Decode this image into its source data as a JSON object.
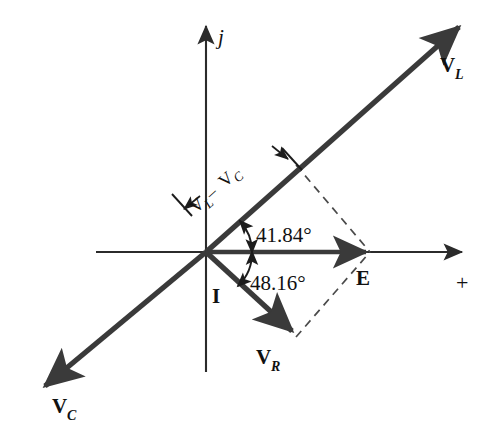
{
  "figure": {
    "background_color": "#ffffff",
    "phasor_color": "#3a3a3a",
    "axis_color": "#2b2b2b",
    "dashed_color": "#4a4a4a",
    "text_color": "#111111"
  },
  "axes": {
    "imaginary": {
      "label": "j",
      "name": "imaginary-axis"
    },
    "real": {
      "label": "+",
      "name": "real-axis"
    }
  },
  "phasors": [
    {
      "id": "VL",
      "label": "V",
      "subscript": "L",
      "name": "phasor-vl",
      "angle_deg": 41.84
    },
    {
      "id": "VC",
      "label": "V",
      "subscript": "C",
      "name": "phasor-vc",
      "angle_deg": 221.84
    },
    {
      "id": "VR",
      "label": "V",
      "subscript": "R",
      "name": "phasor-vr",
      "angle_deg": -48.16
    },
    {
      "id": "I",
      "label": "I",
      "subscript": "",
      "name": "phasor-i",
      "angle_deg": -48.16
    },
    {
      "id": "E",
      "label": "E",
      "subscript": "",
      "name": "phasor-e",
      "angle_deg": 0
    }
  ],
  "annotations": {
    "angle_upper": "41.84°",
    "angle_lower": "48.16°",
    "difference_label": {
      "first": "V",
      "first_sub": "L",
      "operator": " – ",
      "second": "V",
      "second_sub": "C"
    }
  }
}
